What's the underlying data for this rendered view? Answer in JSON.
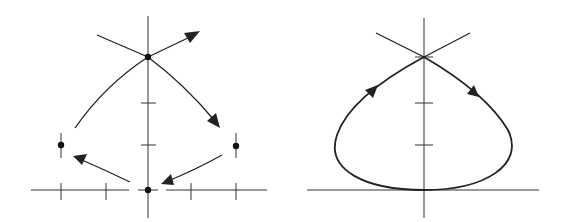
{
  "figure": {
    "panels": [
      {
        "id": "left",
        "description": "Phase portrait with saddle point at top, two centers on sides, and equilibrium at origin; flow arrows circulate clockwise",
        "equilibria": [
          {
            "name": "saddle-top",
            "x": 148,
            "y": 57
          },
          {
            "name": "center-left",
            "x": 61,
            "y": 145
          },
          {
            "name": "center-right",
            "x": 236,
            "y": 146
          },
          {
            "name": "origin",
            "x": 148,
            "y": 190
          }
        ],
        "axis_ticks": {
          "x": [
            61,
            106,
            191,
            236
          ],
          "y": [
            103,
            145
          ]
        }
      },
      {
        "id": "right",
        "description": "Homoclinic orbit loop from saddle point at top, tangent to x-axis at the bottom, traversed clockwise",
        "saddle": {
          "x": 424,
          "y": 57
        },
        "axis_ticks": {
          "y": [
            103,
            145
          ]
        }
      }
    ],
    "colors": {
      "stroke": "#222222",
      "background": "#ffffff"
    }
  }
}
